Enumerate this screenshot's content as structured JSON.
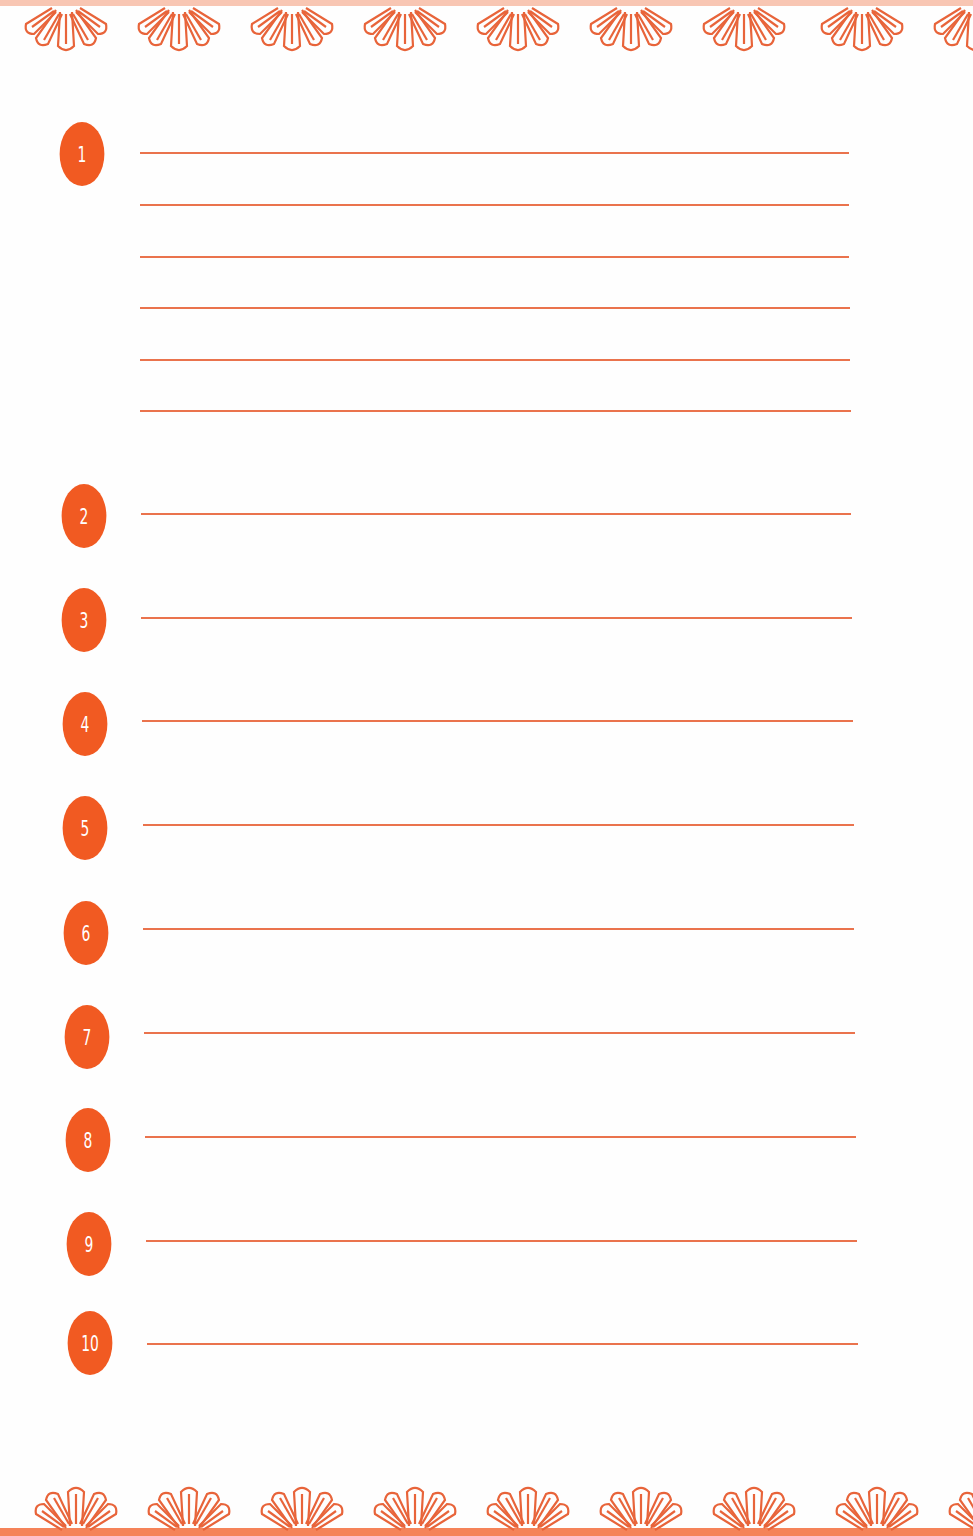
{
  "page": {
    "accent_color": "#f15a22",
    "line_color": "#e8643a",
    "background": "#fefefe"
  },
  "border": {
    "top": {
      "icon": "daisy-half-flower-icon",
      "count": 9
    },
    "bottom": {
      "icon": "daisy-half-flower-icon",
      "count": 9
    }
  },
  "items": [
    {
      "number": "1",
      "lines": 6
    },
    {
      "number": "2",
      "lines": 1
    },
    {
      "number": "3",
      "lines": 1
    },
    {
      "number": "4",
      "lines": 1
    },
    {
      "number": "5",
      "lines": 1
    },
    {
      "number": "6",
      "lines": 1
    },
    {
      "number": "7",
      "lines": 1
    },
    {
      "number": "8",
      "lines": 1
    },
    {
      "number": "9",
      "lines": 1
    },
    {
      "number": "10",
      "lines": 1
    }
  ]
}
